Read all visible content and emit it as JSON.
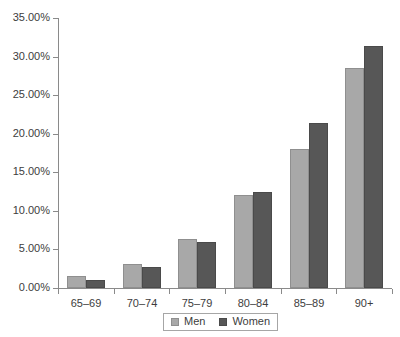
{
  "chart_data": {
    "type": "bar",
    "title": "",
    "subtitle": "",
    "xlabel": "",
    "ylabel": "",
    "categories": [
      "65–69",
      "70–74",
      "75–79",
      "80–84",
      "85–89",
      "90+"
    ],
    "series": [
      {
        "name": "Men",
        "color": "#a8a8a8",
        "values": [
          1.5,
          3.1,
          6.3,
          12.0,
          18.0,
          28.5
        ]
      },
      {
        "name": "Women",
        "color": "#575757",
        "values": [
          1.0,
          2.7,
          6.0,
          12.4,
          21.4,
          31.4
        ]
      }
    ],
    "ylim": [
      0,
      35
    ],
    "ytick_values": [
      0,
      5,
      10,
      15,
      20,
      25,
      30,
      35
    ],
    "ytick_labels": [
      "0.00%",
      "5.00%",
      "10.00%",
      "15.00%",
      "20.00%",
      "25.00%",
      "30.00%",
      "35.00%"
    ],
    "grid": false,
    "legend_position": "bottom",
    "value_format": "percent"
  },
  "legend": {
    "entries": [
      {
        "label": "Men"
      },
      {
        "label": "Women"
      }
    ]
  },
  "colors": {
    "men_fill": "#a8a8a8",
    "women_fill": "#575757",
    "axis": "#8a8a8a",
    "text": "#3d3d3d",
    "background": "#ffffff"
  }
}
